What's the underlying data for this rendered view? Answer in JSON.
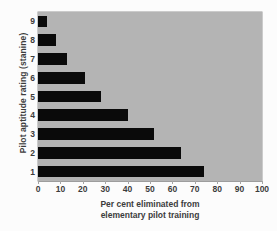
{
  "chart_data": {
    "type": "bar",
    "orientation": "horizontal",
    "title": "",
    "xlabel_line1": "Per cent eliminated from",
    "xlabel_line2": "elementary pilot training",
    "ylabel": "Pilot aptitude rating (stanine)",
    "categories": [
      "9",
      "8",
      "7",
      "6",
      "5",
      "4",
      "3",
      "2",
      "1"
    ],
    "values": [
      4,
      8,
      13,
      21,
      28,
      40,
      52,
      64,
      74
    ],
    "xlim": [
      0,
      100
    ],
    "xticks": [
      0,
      10,
      20,
      30,
      40,
      50,
      60,
      70,
      80,
      90,
      100
    ],
    "xticklabels": [
      "0",
      "10",
      "20",
      "30",
      "40",
      "50",
      "60",
      "70",
      "80",
      "90",
      "100"
    ],
    "grid": false,
    "legend": null,
    "bar_color": "#0a0a0a",
    "plot_background_color": "#b4b4b4",
    "figure_background_color": "#fcfcfc",
    "text_color": "#3c3c3c"
  }
}
